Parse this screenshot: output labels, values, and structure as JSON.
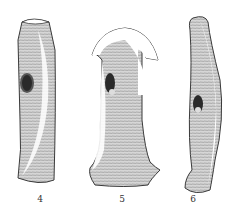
{
  "figure": {
    "items": [
      {
        "label": "4",
        "shape": "straight-axe-with-shaft-hole"
      },
      {
        "label": "5",
        "shape": "hooked-axe-with-flared-blade"
      },
      {
        "label": "6",
        "shape": "curved-double-ended-axe"
      }
    ]
  },
  "colors": {
    "ink": "#3a3a3a",
    "paper": "#ffffff",
    "shade": "#b9b9b9"
  }
}
